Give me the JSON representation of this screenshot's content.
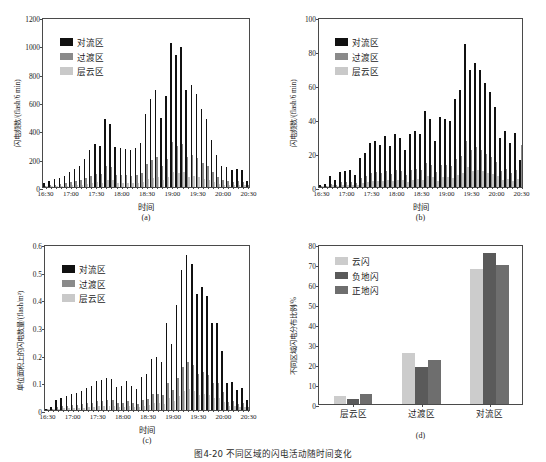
{
  "caption": "图4-20  不同区域的闪电活动随时间变化",
  "legend_abc": {
    "items": [
      {
        "label": "对流区",
        "color": "#111111"
      },
      {
        "label": "过渡区",
        "color": "#8a8a8a"
      },
      {
        "label": "层云区",
        "color": "#c9c9c9"
      }
    ]
  },
  "legend_d": {
    "items": [
      {
        "label": "云闪",
        "color": "#cccccc"
      },
      {
        "label": "负地闪",
        "color": "#5a5a5a"
      },
      {
        "label": "正地闪",
        "color": "#6e6e6e"
      }
    ]
  },
  "time_ticks": [
    "16:30",
    "17:00",
    "17:30",
    "18:00",
    "18:30",
    "19:00",
    "19:30",
    "20:00",
    "20:30"
  ],
  "chart_data": [
    {
      "id": "a",
      "type": "bar",
      "tag": "(a)",
      "title": "",
      "xlabel": "时间",
      "ylabel": "闪电频数/(flash/6 min)",
      "ylim": [
        0,
        1200
      ],
      "yticks": [
        0,
        200,
        400,
        600,
        800,
        1000,
        1200
      ],
      "xlabels": [
        "16:30",
        "17:00",
        "17:30",
        "18:00",
        "18:30",
        "19:00",
        "19:30",
        "20:00",
        "20:30"
      ],
      "x": [
        "16:30",
        "16:36",
        "16:42",
        "16:48",
        "16:54",
        "17:00",
        "17:06",
        "17:12",
        "17:18",
        "17:24",
        "17:30",
        "17:36",
        "17:42",
        "17:48",
        "17:54",
        "18:00",
        "18:06",
        "18:12",
        "18:18",
        "18:24",
        "18:30",
        "18:36",
        "18:42",
        "18:48",
        "18:54",
        "19:00",
        "19:06",
        "19:12",
        "19:18",
        "19:24",
        "19:30",
        "19:36",
        "19:42",
        "19:48",
        "19:54",
        "20:00",
        "20:06",
        "20:12",
        "20:18",
        "20:24",
        "20:30"
      ],
      "series": [
        {
          "name": "对流区",
          "color": "#111111",
          "values": [
            30,
            45,
            55,
            62,
            78,
            105,
            128,
            150,
            200,
            262,
            305,
            292,
            478,
            445,
            285,
            272,
            268,
            258,
            278,
            310,
            515,
            618,
            682,
            484,
            645,
            1020,
            935,
            985,
            683,
            722,
            655,
            550,
            480,
            335,
            225,
            150,
            140,
            118,
            128,
            122,
            40
          ]
        },
        {
          "name": "过渡区",
          "color": "#8a8a8a",
          "values": [
            10,
            14,
            17,
            20,
            25,
            32,
            40,
            48,
            62,
            80,
            95,
            90,
            148,
            138,
            88,
            84,
            83,
            80,
            86,
            96,
            160,
            192,
            212,
            150,
            200,
            317,
            290,
            306,
            212,
            224,
            203,
            171,
            149,
            104,
            70,
            47,
            43,
            37,
            40,
            38,
            12
          ]
        },
        {
          "name": "层云区",
          "color": "#c9c9c9",
          "values": [
            4,
            5,
            6,
            7,
            9,
            11,
            14,
            17,
            22,
            28,
            33,
            31,
            51,
            48,
            31,
            29,
            29,
            28,
            30,
            33,
            55,
            66,
            73,
            52,
            69,
            109,
            100,
            105,
            73,
            77,
            70,
            59,
            51,
            36,
            24,
            16,
            15,
            13,
            14,
            13,
            4
          ]
        }
      ]
    },
    {
      "id": "b",
      "type": "bar",
      "tag": "(b)",
      "title": "",
      "xlabel": "时间",
      "ylabel": "闪电频数/(flash/6 min)",
      "ylim": [
        0,
        100
      ],
      "yticks": [
        0,
        20,
        40,
        60,
        80,
        100
      ],
      "xlabels": [
        "16:30",
        "17:00",
        "17:30",
        "18:00",
        "18:30",
        "19:00",
        "19:30",
        "20:00",
        "20:30"
      ],
      "x": [
        "16:30",
        "16:36",
        "16:42",
        "16:48",
        "16:54",
        "17:00",
        "17:06",
        "17:12",
        "17:18",
        "17:24",
        "17:30",
        "17:36",
        "17:42",
        "17:48",
        "17:54",
        "18:00",
        "18:06",
        "18:12",
        "18:18",
        "18:24",
        "18:30",
        "18:36",
        "18:42",
        "18:48",
        "18:54",
        "19:00",
        "19:06",
        "19:12",
        "19:18",
        "19:24",
        "19:30",
        "19:36",
        "19:42",
        "19:48",
        "19:54",
        "20:00",
        "20:06",
        "20:12",
        "20:18",
        "20:24",
        "20:30"
      ],
      "series": [
        {
          "name": "对流区",
          "color": "#111111",
          "values": [
            1,
            2,
            6.5,
            4,
            9,
            9.5,
            10,
            7,
            17,
            20,
            26,
            27,
            25,
            30,
            24,
            31,
            29,
            22,
            31,
            33,
            31,
            45,
            40,
            27,
            41,
            40,
            39,
            52,
            57,
            84,
            69,
            73,
            69,
            61,
            56,
            47,
            29,
            33,
            26,
            32,
            16
          ]
        },
        {
          "name": "过渡区",
          "color": "#8a8a8a",
          "values": [
            0.4,
            0.7,
            2,
            1.3,
            3,
            3,
            3.2,
            2.2,
            5.4,
            6.4,
            8.3,
            8.6,
            8,
            9.6,
            7.7,
            9.9,
            9.3,
            7,
            9.9,
            10.6,
            9.9,
            14.4,
            12.8,
            8.6,
            13.1,
            12.8,
            12.5,
            16.6,
            18.2,
            26.9,
            22,
            23.4,
            22,
            19.5,
            17.9,
            15,
            9.3,
            10.6,
            8.3,
            10.2,
            25
          ]
        },
        {
          "name": "层云区",
          "color": "#c9c9c9",
          "values": [
            0.2,
            0.3,
            0.9,
            0.6,
            1.3,
            1.3,
            1.4,
            1,
            2.4,
            2.8,
            3.6,
            3.8,
            3.5,
            4.2,
            3.4,
            4.3,
            4.1,
            3.1,
            4.3,
            4.6,
            4.3,
            6.3,
            5.6,
            3.8,
            5.7,
            5.6,
            5.5,
            7.3,
            8,
            11.8,
            9.7,
            10.2,
            9.7,
            8.5,
            7.8,
            6.6,
            4.1,
            4.6,
            3.6,
            4.5,
            2.2
          ]
        }
      ]
    },
    {
      "id": "c",
      "type": "bar",
      "tag": "(c)",
      "title": "",
      "xlabel": "时间",
      "ylabel": "单位面积上的闪电数量/(flash/m²)",
      "ylim": [
        0,
        0.6
      ],
      "yticks": [
        0,
        0.1,
        0.2,
        0.3,
        0.4,
        0.5,
        0.6
      ],
      "xlabels": [
        "16:30",
        "17:00",
        "17:30",
        "18:00",
        "18:30",
        "19:00",
        "19:30",
        "20:00",
        "20:30"
      ],
      "x": [
        "16:30",
        "16:36",
        "16:42",
        "16:48",
        "16:54",
        "17:00",
        "17:06",
        "17:12",
        "17:18",
        "17:24",
        "17:30",
        "17:36",
        "17:42",
        "17:48",
        "17:54",
        "18:00",
        "18:06",
        "18:12",
        "18:18",
        "18:24",
        "18:30",
        "18:36",
        "18:42",
        "18:48",
        "18:54",
        "19:00",
        "19:06",
        "19:12",
        "19:18",
        "19:24",
        "19:30",
        "19:36",
        "19:42",
        "19:48",
        "19:54",
        "20:00",
        "20:06",
        "20:12",
        "20:18",
        "20:24",
        "20:30"
      ],
      "series": [
        {
          "name": "对流区",
          "color": "#111111",
          "values": [
            0.004,
            0.012,
            0.038,
            0.045,
            0.052,
            0.058,
            0.062,
            0.07,
            0.078,
            0.085,
            0.104,
            0.108,
            0.115,
            0.113,
            0.082,
            0.085,
            0.106,
            0.088,
            0.075,
            0.12,
            0.131,
            0.185,
            0.19,
            0.172,
            0.315,
            0.24,
            0.378,
            0.505,
            0.56,
            0.528,
            0.42,
            0.445,
            0.412,
            0.315,
            0.315,
            0.214,
            0.098,
            0.1,
            0.072,
            0.078,
            0.035
          ]
        },
        {
          "name": "过渡区",
          "color": "#8a8a8a",
          "values": [
            0.001,
            0.004,
            0.012,
            0.014,
            0.016,
            0.018,
            0.019,
            0.022,
            0.024,
            0.026,
            0.032,
            0.034,
            0.036,
            0.035,
            0.025,
            0.026,
            0.033,
            0.027,
            0.023,
            0.037,
            0.041,
            0.057,
            0.059,
            0.053,
            0.098,
            0.074,
            0.117,
            0.157,
            0.174,
            0.164,
            0.13,
            0.138,
            0.128,
            0.098,
            0.098,
            0.066,
            0.03,
            0.031,
            0.022,
            0.024,
            0.011
          ]
        },
        {
          "name": "层云区",
          "color": "#c9c9c9",
          "values": [
            0.0005,
            0.0015,
            0.005,
            0.006,
            0.007,
            0.008,
            0.008,
            0.009,
            0.01,
            0.011,
            0.014,
            0.015,
            0.016,
            0.015,
            0.011,
            0.011,
            0.014,
            0.012,
            0.01,
            0.016,
            0.018,
            0.025,
            0.026,
            0.023,
            0.042,
            0.032,
            0.05,
            0.067,
            0.075,
            0.07,
            0.056,
            0.059,
            0.055,
            0.042,
            0.042,
            0.028,
            0.013,
            0.013,
            0.01,
            0.01,
            0.005
          ]
        }
      ]
    },
    {
      "id": "d",
      "type": "bar",
      "tag": "(d)",
      "title": "",
      "xlabel": "",
      "ylabel": "不同区域闪电分布比例/%",
      "ylim": [
        0,
        80
      ],
      "yticks": [
        0,
        10,
        20,
        30,
        40,
        50,
        60,
        70,
        80
      ],
      "categories": [
        "层云区",
        "过渡区",
        "对流区"
      ],
      "series": [
        {
          "name": "云闪",
          "color": "#cccccc",
          "values": [
            4.2,
            25.4,
            67.5
          ]
        },
        {
          "name": "负地闪",
          "color": "#5a5a5a",
          "values": [
            2.3,
            18.5,
            75.7
          ]
        },
        {
          "name": "正地闪",
          "color": "#6e6e6e",
          "values": [
            4.8,
            22.1,
            69.3
          ]
        }
      ]
    }
  ]
}
